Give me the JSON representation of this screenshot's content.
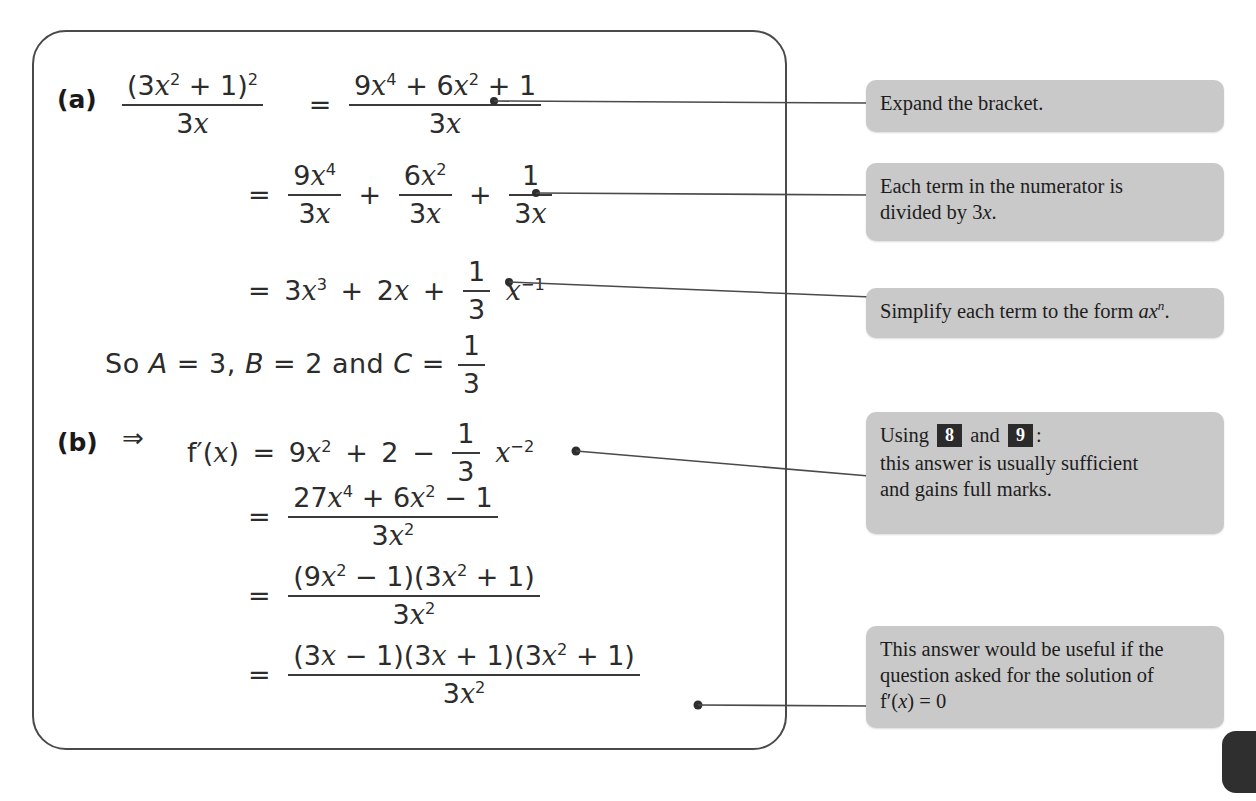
{
  "document": {
    "type": "worked-solution",
    "panel_label": "solution-panel"
  },
  "solution": {
    "part_a": {
      "label": "(a)",
      "lines": [
        {
          "id": "a1",
          "lhs_frac": {
            "num": "(3x² + 1)²",
            "den": "3x"
          },
          "relation": "=",
          "rhs_frac": {
            "num": "9x⁴ + 6x² + 1",
            "den": "3x"
          }
        },
        {
          "id": "a2",
          "relation": "=",
          "terms": [
            {
              "num": "9x⁴",
              "den": "3x"
            },
            {
              "op": "+"
            },
            {
              "num": "6x²",
              "den": "3x"
            },
            {
              "op": "+"
            },
            {
              "num": "1",
              "den": "3x"
            }
          ]
        },
        {
          "id": "a3",
          "relation": "=",
          "expression": "3x³ + 2x + (1/3)x⁻¹"
        }
      ],
      "conclusion": "So A = 3, B = 2 and C = 1/3"
    },
    "part_b": {
      "label": "(b)",
      "implies": "⇒",
      "lines": [
        {
          "id": "b1",
          "expression": "f′(x) = 9x² + 2 − (1/3)x⁻²"
        },
        {
          "id": "b2",
          "relation": "=",
          "num": "27x⁴ + 6x² − 1",
          "den": "3x²"
        },
        {
          "id": "b3",
          "relation": "=",
          "num": "(9x² − 1)(3x² + 1)",
          "den": "3x²"
        },
        {
          "id": "b4",
          "relation": "=",
          "num": "(3x − 1)(3x + 1)(3x² + 1)",
          "den": "3x²"
        }
      ]
    }
  },
  "math_glyphs": {
    "open_paren": "(",
    "close_paren": ")",
    "three": "3",
    "nine": "9",
    "six": "6",
    "one": "1",
    "two": "2",
    "seven": "7",
    "zero": "0",
    "equals": "=",
    "plus": "+",
    "minus": "−",
    "implies": "⇒",
    "var_x": "x",
    "fn_f": "f",
    "prime": "′",
    "comma": ",",
    "const_A": "A",
    "const_B": "B",
    "const_C": "C",
    "word_so": "So",
    "word_and": "and"
  },
  "callouts": [
    {
      "id": "callout-expand",
      "text": "Expand the bracket."
    },
    {
      "id": "callout-divide",
      "line1": "Each term in the numerator is",
      "line2_pre": "divided by 3",
      "line2_var": "x",
      "line2_post": "."
    },
    {
      "id": "callout-simplify",
      "pre": "Simplify each term to the form ",
      "form_a": "a",
      "form_x": "x",
      "form_n": "n",
      "post": "."
    },
    {
      "id": "callout-using",
      "line1_pre": "Using ",
      "badge1": "8",
      "line1_mid": " and ",
      "badge2": "9",
      "line1_post": ":",
      "line2": "this answer is usually sufficient",
      "line3": "and gains full marks."
    },
    {
      "id": "callout-solution",
      "line1": "This answer would be useful if the",
      "line2": "question asked for the solution of",
      "line3_f": "f",
      "line3_prime": "′",
      "line3_open": "(",
      "line3_var": "x",
      "line3_close": ")",
      "line3_eq": " = 0"
    }
  ],
  "colors": {
    "callout_bg": "#c9c9c9",
    "badge_bg": "#2b2b2b",
    "ink": "#2c2c2c",
    "panel_border": "#4a4a4a",
    "page_tab": "#2f2f2f"
  },
  "page_tab": {
    "name": "page-edge-tab"
  }
}
